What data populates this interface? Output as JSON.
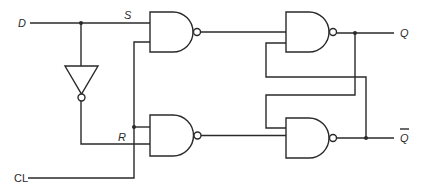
{
  "diagram": {
    "type": "gated D latch (NAND implementation)",
    "labels": {
      "input_d": "D",
      "input_clock": "CL",
      "node_s": "S",
      "node_r": "R",
      "output_q": "Q",
      "output_q_bar": "Q"
    },
    "components": [
      {
        "id": "inverter",
        "kind": "NOT"
      },
      {
        "id": "gate-s",
        "kind": "NAND",
        "inputs": [
          "D",
          "CL"
        ],
        "output": "S-bar"
      },
      {
        "id": "gate-r",
        "kind": "NAND",
        "inputs": [
          "CL",
          "NOT D"
        ],
        "output": "R-bar"
      },
      {
        "id": "gate-q",
        "kind": "NAND",
        "inputs": [
          "S-bar",
          "Q-bar"
        ],
        "output": "Q"
      },
      {
        "id": "gate-qbar",
        "kind": "NAND",
        "inputs": [
          "Q",
          "R-bar"
        ],
        "output": "Q-bar"
      }
    ],
    "colors": {
      "ink": "#2a2a2a",
      "background": "#ffffff"
    }
  }
}
